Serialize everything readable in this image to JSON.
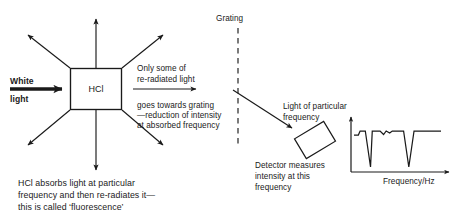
{
  "figure": {
    "title_absent": true,
    "background_color": "#ffffff",
    "ink_color": "#1a1a1a"
  },
  "source_labels": {
    "white": "White",
    "light": "light"
  },
  "sample": {
    "box_label": "HCl"
  },
  "reradiation_note": {
    "line1": "Only some of",
    "line2": "re-radiated light",
    "line3": "goes towards grating",
    "line4": "—reduction of intensity",
    "line5": "at absorbed frequency"
  },
  "grating": {
    "label": "Grating"
  },
  "beam_note": {
    "line1": "Light of particular",
    "line2": "frequency"
  },
  "detector_note": {
    "line1": "Detector measures",
    "line2": "intensity at this",
    "line3": "frequency"
  },
  "caption": {
    "line1": "HCl absorbs light at particular",
    "line2": "frequency and then re-radiates it—",
    "line3": "this is called ‘fluorescence’"
  },
  "chart_data": {
    "type": "line",
    "title": "",
    "xlabel": "Frequency/Hz",
    "ylabel": "",
    "grid": false,
    "legend": false,
    "axis_arrows": {
      "x": true,
      "y": true
    },
    "xlim": [
      0,
      100
    ],
    "ylim": [
      0,
      100
    ],
    "x": [
      0,
      5,
      7,
      13,
      19,
      21,
      30,
      34,
      37,
      41,
      44,
      48,
      52,
      54,
      57,
      63,
      69,
      71,
      82,
      100
    ],
    "y": [
      72,
      72,
      80,
      80,
      8,
      80,
      80,
      73,
      80,
      76,
      80,
      80,
      80,
      80,
      80,
      8,
      80,
      80,
      80,
      80
    ],
    "series": [
      {
        "name": "intensity",
        "values": [
          72,
          72,
          80,
          80,
          8,
          80,
          80,
          73,
          80,
          76,
          80,
          80,
          80,
          80,
          80,
          8,
          80,
          80,
          80,
          80
        ]
      }
    ],
    "dips": [
      {
        "center_x": 19,
        "depth_y": 8
      },
      {
        "center_x": 63,
        "depth_y": 8
      }
    ],
    "notches": [
      {
        "center_x": 34,
        "depth_y": 73
      },
      {
        "center_x": 41,
        "depth_y": 76
      }
    ],
    "baseline_y": 80
  }
}
